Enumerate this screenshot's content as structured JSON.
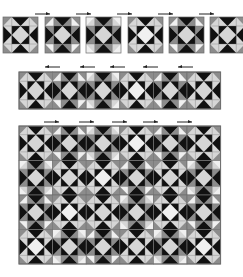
{
  "figure": {
    "colors": {
      "dark": "#111111",
      "medium": "#8c8c8c",
      "light": "#d6d6d6",
      "lightest": "#f0f0f0",
      "border": "#6e6e6e",
      "arrow": "#222222"
    },
    "rows": [
      {
        "id": "single-blocks",
        "blocks": [
          {
            "x": 3,
            "y": 17,
            "size": 35,
            "variant": "a"
          },
          {
            "x": 45,
            "y": 17,
            "size": 35,
            "variant": "b"
          },
          {
            "x": 86,
            "y": 17,
            "size": 35,
            "variant": "c"
          },
          {
            "x": 128,
            "y": 17,
            "size": 35,
            "variant": "d"
          },
          {
            "x": 169,
            "y": 17,
            "size": 35,
            "variant": "b"
          },
          {
            "x": 210,
            "y": 17,
            "size": 35,
            "variant": "a"
          }
        ],
        "arrows": [
          {
            "x": 35,
            "y": 14,
            "len": 15,
            "dir": "right"
          },
          {
            "x": 76,
            "y": 14,
            "len": 15,
            "dir": "right"
          },
          {
            "x": 117,
            "y": 14,
            "len": 15,
            "dir": "right"
          },
          {
            "x": 158,
            "y": 14,
            "len": 15,
            "dir": "right"
          },
          {
            "x": 199,
            "y": 14,
            "len": 15,
            "dir": "right"
          }
        ]
      },
      {
        "id": "joined-strip",
        "x": 19,
        "y": 72,
        "cols": 6,
        "rows": 1,
        "cell": 33.6,
        "cellH": 37,
        "variants": [
          "a",
          "b",
          "c",
          "d",
          "b",
          "a"
        ],
        "arrows": [
          {
            "x": 45,
            "y": 67,
            "len": 15,
            "dir": "left"
          },
          {
            "x": 80,
            "y": 67,
            "len": 15,
            "dir": "left"
          },
          {
            "x": 110,
            "y": 67,
            "len": 15,
            "dir": "left"
          },
          {
            "x": 143,
            "y": 67,
            "len": 15,
            "dir": "left"
          },
          {
            "x": 178,
            "y": 67,
            "len": 15,
            "dir": "left"
          }
        ]
      },
      {
        "id": "assembled-quilt",
        "x": 19,
        "y": 126,
        "cols": 6,
        "rows": 4,
        "cell": 33.6,
        "cellH": 34.5,
        "variants": [
          [
            "a",
            "b",
            "c",
            "d",
            "b",
            "a"
          ],
          [
            "c",
            "a",
            "d",
            "b",
            "a",
            "c"
          ],
          [
            "b",
            "d",
            "a",
            "c",
            "d",
            "b"
          ],
          [
            "d",
            "c",
            "b",
            "a",
            "c",
            "d"
          ]
        ],
        "arrows": [
          {
            "x": 44,
            "y": 122,
            "len": 15,
            "dir": "right"
          },
          {
            "x": 79,
            "y": 122,
            "len": 15,
            "dir": "right"
          },
          {
            "x": 112,
            "y": 122,
            "len": 15,
            "dir": "right"
          },
          {
            "x": 143,
            "y": 122,
            "len": 15,
            "dir": "right"
          },
          {
            "x": 177,
            "y": 122,
            "len": 15,
            "dir": "right"
          }
        ]
      }
    ],
    "variants": {
      "a": {
        "center": "light",
        "corner": "light",
        "cornerTri": "medium",
        "edge": "dark",
        "edgeSide": "light"
      },
      "b": {
        "center": "light",
        "corner": "lightest",
        "cornerTri": "medium",
        "edge": "dark",
        "edgeSide": "medium"
      },
      "c": {
        "center": "light",
        "corner": "light",
        "cornerTri": "lightest",
        "edge": "dark",
        "edgeSide": "medium"
      },
      "d": {
        "center": "lightest",
        "corner": "light",
        "cornerTri": "medium",
        "edge": "dark",
        "edgeSide": "light"
      }
    }
  }
}
